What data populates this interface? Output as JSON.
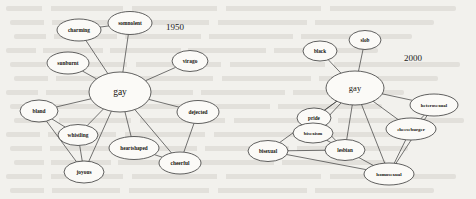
{
  "figure": {
    "background_color": "#f2f1ed",
    "node_fill": "#fbfaf7",
    "node_stroke": "#2e2e2e",
    "edge_color": "#3a3a3a"
  },
  "panels": [
    {
      "name": "panel-1950",
      "year_label": "1950",
      "year_pos": {
        "x": 175,
        "y": 27
      },
      "hub": "gay",
      "nodes": [
        {
          "id": "gay",
          "label": "gay",
          "x": 120,
          "y": 92,
          "rx": 31,
          "ry": 20,
          "fs": 9.5,
          "hub": true
        },
        {
          "id": "charming",
          "label": "charming",
          "x": 79,
          "y": 30,
          "rx": 22,
          "ry": 11,
          "fs": 5.4
        },
        {
          "id": "somnolent",
          "label": "somnolent",
          "x": 130,
          "y": 23,
          "rx": 22,
          "ry": 11.5,
          "fs": 5.4
        },
        {
          "id": "sunburnt",
          "label": "sunburnt",
          "x": 68,
          "y": 63,
          "rx": 21,
          "ry": 11,
          "fs": 5.4
        },
        {
          "id": "virago",
          "label": "virago",
          "x": 190,
          "y": 61,
          "rx": 18,
          "ry": 10.5,
          "fs": 5.4
        },
        {
          "id": "bland",
          "label": "bland",
          "x": 39,
          "y": 111,
          "rx": 19,
          "ry": 11,
          "fs": 5.4
        },
        {
          "id": "whistling",
          "label": "whistling",
          "x": 78,
          "y": 135,
          "rx": 20,
          "ry": 10.5,
          "fs": 5.4
        },
        {
          "id": "joyous",
          "label": "joyous",
          "x": 84,
          "y": 172,
          "rx": 20,
          "ry": 11,
          "fs": 5.4
        },
        {
          "id": "heartshaped",
          "label": "heartshaped",
          "x": 134,
          "y": 148,
          "rx": 25,
          "ry": 11.5,
          "fs": 5.2
        },
        {
          "id": "cheerful",
          "label": "cheerful",
          "x": 180,
          "y": 163,
          "rx": 21,
          "ry": 11,
          "fs": 5.4
        },
        {
          "id": "dejected",
          "label": "dejected",
          "x": 198,
          "y": 112,
          "rx": 21,
          "ry": 11.5,
          "fs": 5.4
        }
      ],
      "edges": [
        [
          "gay",
          "charming"
        ],
        [
          "gay",
          "somnolent"
        ],
        [
          "gay",
          "sunburnt"
        ],
        [
          "gay",
          "virago"
        ],
        [
          "gay",
          "bland"
        ],
        [
          "gay",
          "whistling"
        ],
        [
          "gay",
          "joyous"
        ],
        [
          "gay",
          "heartshaped"
        ],
        [
          "gay",
          "cheerful"
        ],
        [
          "gay",
          "dejected"
        ],
        [
          "charming",
          "somnolent"
        ],
        [
          "bland",
          "whistling"
        ],
        [
          "bland",
          "joyous"
        ],
        [
          "whistling",
          "joyous"
        ],
        [
          "heartshaped",
          "cheerful"
        ],
        [
          "dejected",
          "cheerful"
        ]
      ]
    },
    {
      "name": "panel-2000",
      "year_label": "2000",
      "year_pos": {
        "x": 413,
        "y": 58
      },
      "hub": "gay",
      "nodes": [
        {
          "id": "gay",
          "label": "gay",
          "x": 355,
          "y": 88,
          "rx": 29,
          "ry": 17,
          "fs": 8.5,
          "hub": true
        },
        {
          "id": "black",
          "label": "black",
          "x": 320,
          "y": 51,
          "rx": 17,
          "ry": 10,
          "fs": 5.2
        },
        {
          "id": "slob",
          "label": "slob",
          "x": 365,
          "y": 40,
          "rx": 16,
          "ry": 9.5,
          "fs": 5.2
        },
        {
          "id": "pride",
          "label": "pride",
          "x": 314,
          "y": 118,
          "rx": 17,
          "ry": 10,
          "fs": 5.2
        },
        {
          "id": "bisexism",
          "label": "bisexism",
          "x": 313,
          "y": 133,
          "rx": 20,
          "ry": 10,
          "fs": 5.0
        },
        {
          "id": "lesbian",
          "label": "lesbian",
          "x": 345,
          "y": 150,
          "rx": 20,
          "ry": 10.5,
          "fs": 5.2
        },
        {
          "id": "bisexual",
          "label": "bisexual",
          "x": 268,
          "y": 151,
          "rx": 20,
          "ry": 10.5,
          "fs": 5.2
        },
        {
          "id": "cheeseburger",
          "label": "cheeseburger",
          "x": 411,
          "y": 129,
          "rx": 25,
          "ry": 11,
          "fs": 4.9
        },
        {
          "id": "heterosexual",
          "label": "heterosexual",
          "x": 434,
          "y": 105,
          "rx": 24,
          "ry": 11,
          "fs": 4.9
        },
        {
          "id": "homosexual",
          "label": "homosexual",
          "x": 389,
          "y": 174,
          "rx": 25,
          "ry": 11,
          "fs": 5.0
        }
      ],
      "edges": [
        [
          "gay",
          "black"
        ],
        [
          "gay",
          "slob"
        ],
        [
          "gay",
          "pride"
        ],
        [
          "gay",
          "bisexism"
        ],
        [
          "gay",
          "lesbian"
        ],
        [
          "gay",
          "bisexual"
        ],
        [
          "gay",
          "cheeseburger"
        ],
        [
          "gay",
          "heterosexual"
        ],
        [
          "gay",
          "homosexual"
        ],
        [
          "pride",
          "lesbian"
        ],
        [
          "bisexism",
          "lesbian"
        ],
        [
          "bisexual",
          "lesbian"
        ],
        [
          "bisexual",
          "homosexual"
        ],
        [
          "lesbian",
          "homosexual"
        ],
        [
          "cheeseburger",
          "homosexual"
        ],
        [
          "heterosexual",
          "homosexual"
        ],
        [
          "heterosexual",
          "cheeseburger"
        ]
      ]
    }
  ]
}
